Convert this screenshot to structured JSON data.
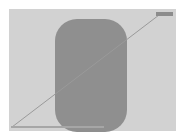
{
  "canvas": {
    "width": 182,
    "height": 139,
    "background_color": "#ffffff",
    "alt_text": "Abstract minimal graphic"
  },
  "panel": {
    "label": "",
    "color": "#d2d2d2",
    "x": 9,
    "y": 9,
    "width": 167,
    "height": 122
  },
  "shape": {
    "kind": "rounded-rectangle",
    "label": "",
    "color": "#8f8f8f",
    "corner_radius": 22,
    "x": 46,
    "y": 10,
    "width": 72,
    "height": 113
  },
  "diagonal": {
    "kind": "line",
    "label": "",
    "color": "#9a9a9a",
    "stroke_width": 1,
    "x1": 3,
    "y1": 118,
    "x2": 150,
    "y2": 6
  },
  "bottom_bar": {
    "label": "",
    "color": "#a6a6a6",
    "x": 2,
    "y": 117,
    "width": 93,
    "height": 2
  },
  "corner_swatch": {
    "label": "",
    "color": "#8c8c8c",
    "x": 147,
    "y": 3,
    "width": 17,
    "height": 4
  }
}
